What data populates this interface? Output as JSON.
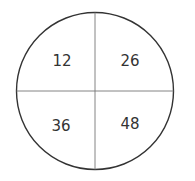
{
  "diagram": {
    "type": "circle-quadrants",
    "quadrants": [
      {
        "position": "top-left",
        "value": "12"
      },
      {
        "position": "top-right",
        "value": "26"
      },
      {
        "position": "bottom-left",
        "value": "36"
      },
      {
        "position": "bottom-right",
        "value": "48"
      }
    ],
    "colors": {
      "stroke": "#333333",
      "divider": "#666666",
      "background": "#ffffff"
    }
  }
}
